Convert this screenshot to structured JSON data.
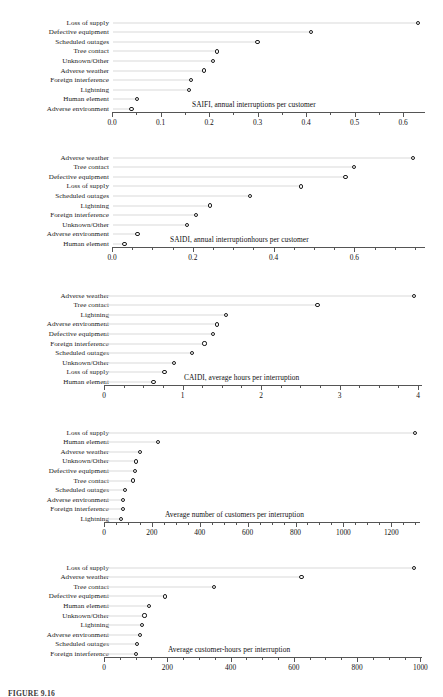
{
  "figure": {
    "caption": "FIGURE 9.16",
    "width": 443,
    "height": 695
  },
  "chart_data": [
    {
      "type": "bar",
      "style": "cleveland-dot-plot",
      "title": "SAIFI, annual interruptions per customer",
      "xlabel": "",
      "ylabel": "",
      "xlim": [
        0.0,
        0.645
      ],
      "grid": false,
      "legend": "none",
      "xticks": [
        "0.0",
        "0.1",
        "0.2",
        "0.3",
        "0.4",
        "0.5",
        "0.6"
      ],
      "xtickvalues": [
        0.0,
        0.1,
        0.2,
        0.3,
        0.4,
        0.5,
        0.6
      ],
      "minor_tick_step": 0.05,
      "categories": [
        "Loss of supply",
        "Defective equipment",
        "Scheduled outages",
        "Tree contact",
        "Unknown/Other",
        "Adverse weather",
        "Foreign interference",
        "Lightning",
        "Human element",
        "Adverse environment"
      ],
      "values": [
        0.63,
        0.41,
        0.3,
        0.216,
        0.208,
        0.19,
        0.162,
        0.159,
        0.052,
        0.04
      ]
    },
    {
      "type": "bar",
      "style": "cleveland-dot-plot",
      "title": "SAIDI, annual interruptionhours per customer",
      "xlabel": "",
      "ylabel": "",
      "xlim": [
        0.0,
        0.775
      ],
      "grid": false,
      "legend": "none",
      "xticks": [
        "0.0",
        "0.2",
        "0.4",
        "0.6"
      ],
      "xtickvalues": [
        0.0,
        0.2,
        0.4,
        0.6
      ],
      "minor_tick_step": 0.05,
      "categories": [
        "Adverse weather",
        "Tree contact",
        "Defective equipment",
        "Loss of supply",
        "Scheduled outages",
        "Lightning",
        "Foreign interference",
        "Unknown/Other",
        "Adverse environment",
        "Human element"
      ],
      "values": [
        0.745,
        0.6,
        0.578,
        0.468,
        0.342,
        0.243,
        0.208,
        0.185,
        0.063,
        0.031
      ]
    },
    {
      "type": "bar",
      "style": "cleveland-dot-plot",
      "title": "CAIDI, average hours per interruption",
      "xlabel": "",
      "ylabel": "",
      "xlim": [
        0,
        4.05
      ],
      "grid": false,
      "legend": "none",
      "xticks": [
        "0",
        "1",
        "2",
        "3",
        "4"
      ],
      "xtickvalues": [
        0,
        1,
        2,
        3,
        4
      ],
      "minor_tick_step": 0.25,
      "categories": [
        "Adverse weather",
        "Tree contact",
        "Lightning",
        "Adverse environment",
        "Defective equipment",
        "Foreign interference",
        "Scheduled outages",
        "Unknown/Other",
        "Loss of supply",
        "Human element"
      ],
      "values": [
        3.95,
        2.72,
        1.55,
        1.44,
        1.39,
        1.28,
        1.12,
        0.89,
        0.77,
        0.63
      ]
    },
    {
      "type": "bar",
      "style": "cleveland-dot-plot",
      "title": "Average number of customers per interruption",
      "xlabel": "",
      "ylabel": "",
      "xlim": [
        0,
        1320
      ],
      "grid": false,
      "legend": "none",
      "xticks": [
        "0",
        "200",
        "400",
        "600",
        "800",
        "1000",
        "1200"
      ],
      "xtickvalues": [
        0,
        200,
        400,
        600,
        800,
        1000,
        1200
      ],
      "minor_tick_step": 50,
      "categories": [
        "Loss of supply",
        "Human element",
        "Adverse weather",
        "Unknown/Other",
        "Defective equipment",
        "Tree contact",
        "Scheduled outages",
        "Adverse environment",
        "Foreign interference",
        "Lightning"
      ],
      "values": [
        1300,
        226,
        150,
        133,
        130,
        120,
        88,
        80,
        78,
        72
      ]
    },
    {
      "type": "bar",
      "style": "cleveland-dot-plot",
      "title": "Average customer-hours per interruption",
      "xlabel": "",
      "ylabel": "",
      "xlim": [
        0,
        1005
      ],
      "grid": false,
      "legend": "none",
      "xticks": [
        "0",
        "200",
        "400",
        "600",
        "800",
        "1000"
      ],
      "xtickvalues": [
        0,
        200,
        400,
        600,
        800,
        1000
      ],
      "minor_tick_step": 50,
      "categories": [
        "Loss of supply",
        "Adverse weather",
        "Tree contact",
        "Defective equipment",
        "Human element",
        "Unknown/Other",
        "Lightning",
        "Adverse environment",
        "Scheduled outages",
        "Foreign interference"
      ],
      "values": [
        980,
        624,
        348,
        192,
        142,
        128,
        120,
        114,
        105,
        100
      ]
    }
  ]
}
